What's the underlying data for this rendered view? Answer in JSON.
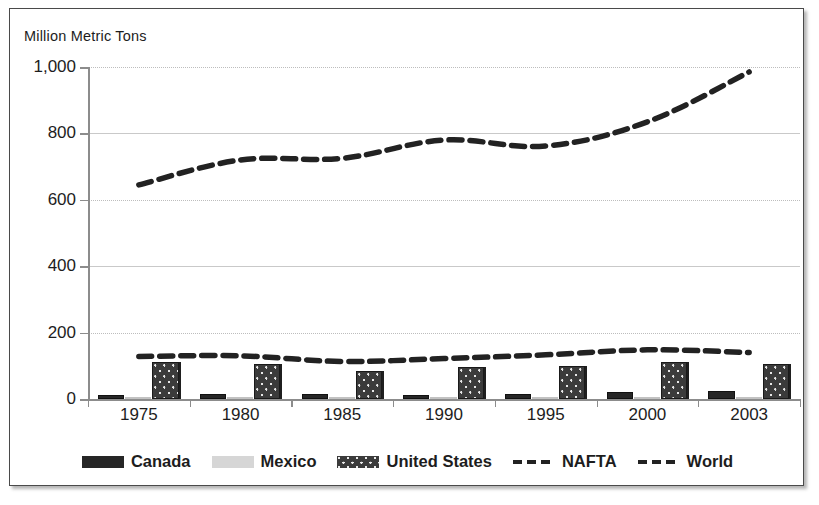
{
  "axis_title": "Million  Metric Tons",
  "legend": [
    {
      "label": "Canada",
      "swatch": "canada",
      "type": "bar"
    },
    {
      "label": "Mexico",
      "swatch": "mexico",
      "type": "bar"
    },
    {
      "label": "United States",
      "swatch": "usa",
      "type": "bar"
    },
    {
      "label": "NAFTA",
      "swatch": "dash",
      "type": "line"
    },
    {
      "label": "World",
      "swatch": "dash",
      "type": "line"
    }
  ],
  "colors": {
    "canada": "#262626",
    "mexico": "#d4d4d4",
    "united_states": "#3b3b3b",
    "nafta": "#222222",
    "world": "#222222",
    "gridline": "#c9c9c9",
    "axis": "#8c8c8c",
    "frame": "#4a4a4a",
    "text": "#1d1d1d"
  },
  "chart_data": {
    "type": "bar",
    "title": "",
    "xlabel": "",
    "ylabel": "Million  Metric Tons",
    "ylim": [
      0,
      1000
    ],
    "yticks": [
      0,
      200,
      400,
      600,
      800,
      1000
    ],
    "ytick_labels": [
      "0",
      "200",
      "400",
      "600",
      "800",
      "1,000"
    ],
    "categories": [
      "1975",
      "1980",
      "1985",
      "1990",
      "1995",
      "2000",
      "2003"
    ],
    "grid": true,
    "legend_position": "bottom",
    "series": [
      {
        "name": "Canada",
        "kind": "bar",
        "values": [
          12,
          15,
          14,
          12,
          16,
          20,
          23
        ]
      },
      {
        "name": "Mexico",
        "kind": "bar",
        "values": [
          3,
          4,
          5,
          4,
          5,
          6,
          7
        ]
      },
      {
        "name": "United States",
        "kind": "bar",
        "values": [
          110,
          105,
          85,
          95,
          100,
          112,
          104
        ]
      },
      {
        "name": "NAFTA",
        "kind": "line",
        "values": [
          128,
          130,
          113,
          122,
          133,
          148,
          140
        ]
      },
      {
        "name": "World",
        "kind": "line",
        "values": [
          645,
          720,
          725,
          780,
          762,
          835,
          985
        ]
      }
    ]
  }
}
